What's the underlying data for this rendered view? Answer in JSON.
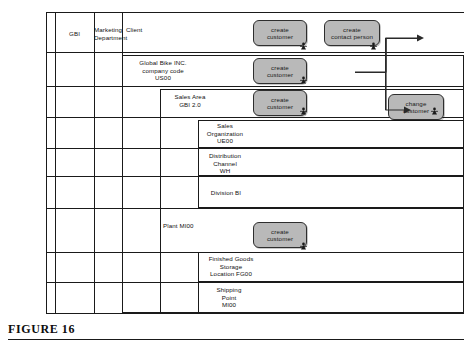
{
  "figure": {
    "caption": "FIGURE 16"
  },
  "lanes": [
    {
      "label": "GBI"
    },
    {
      "label": "Marketing\nDepartment"
    },
    {
      "label": "Client"
    }
  ],
  "lane_labels": {
    "gbi": "GBI",
    "marketing_line1": "Marketing",
    "marketing_line2": "Department",
    "client": "Client"
  },
  "org_units": {
    "company": {
      "line1": "Global Bike INC.",
      "line2": "company code",
      "line3": "US00"
    },
    "sales_area": {
      "line1": "Sales Area",
      "line2": "GBI 2.0"
    },
    "sales_organization": {
      "line1": "Sales",
      "line2": "Organization",
      "line3": "UE00"
    },
    "distribution_channel": {
      "line1": "Distribution",
      "line2": "Channel",
      "line3": "WH"
    },
    "division": {
      "line1": "Division BI"
    },
    "plant": {
      "line1": "Plant MI00"
    },
    "storage_location": {
      "line1": "Finished Goods",
      "line2": "Storage",
      "line3": "Location FG00"
    },
    "shipping_point": {
      "line1": "Shipping",
      "line2": "Point",
      "line3": "MI00"
    }
  },
  "processes": [
    {
      "id": "create-customer-1",
      "line1": "create",
      "line2": "customer"
    },
    {
      "id": "create-contact-person",
      "line1": "create",
      "line2": "contact person"
    },
    {
      "id": "create-customer-2",
      "line1": "create",
      "line2": "customer"
    },
    {
      "id": "create-customer-3",
      "line1": "create",
      "line2": "customer"
    },
    {
      "id": "change-customer",
      "line1": "change",
      "line2": "customer"
    },
    {
      "id": "create-customer-4",
      "line1": "create",
      "line2": "customer"
    }
  ],
  "colors": {
    "process_fill": "#b9b9b9",
    "line": "#1a1a1a",
    "text": "#111111"
  }
}
